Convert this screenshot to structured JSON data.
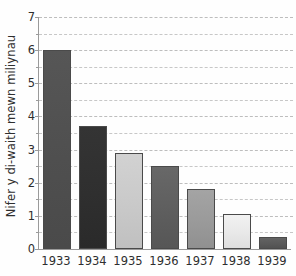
{
  "chart_data": {
    "type": "bar",
    "title": "",
    "subtitle": "",
    "xlabel": "",
    "ylabel": "Nifer y di-waith mewn miliynau",
    "categories": [
      "1933",
      "1934",
      "1935",
      "1936",
      "1937",
      "1938",
      "1939"
    ],
    "values": [
      6.0,
      3.7,
      2.9,
      2.5,
      1.8,
      1.05,
      0.35
    ],
    "ylim": [
      0,
      7
    ],
    "xlim_note": "categorical",
    "y_ticks": [
      0,
      1,
      2,
      3,
      4,
      5,
      6,
      7
    ],
    "y_tick_labels": [
      "0",
      "1",
      "2",
      "3",
      "4",
      "5",
      "6",
      "7"
    ],
    "gridlines": {
      "horizontal": true,
      "vertical": false,
      "style": "dashed",
      "interval": 0.5,
      "color": "#c7c7c7",
      "values": [
        0.5,
        1,
        1.5,
        2,
        2.5,
        3,
        3.5,
        4,
        4.5,
        5,
        5.5,
        6,
        6.5,
        7
      ]
    },
    "legend": {
      "visible": false,
      "position": "none",
      "entries": []
    },
    "annotations": [],
    "bar_colors": [
      "#4f4f4f",
      "#2f2f2f",
      "#c9c9c9",
      "#5e5e5e",
      "#9a9a9a",
      "#e8e8e8",
      "#5a5a5a"
    ],
    "bar_gradient_tops": [
      "#565656",
      "#343434",
      "#d2d2d2",
      "#686868",
      "#a4a4a4",
      "#f1f1f1",
      "#636363"
    ],
    "bar_gradient_bottoms": [
      "#4a4a4a",
      "#2a2a2a",
      "#c0c0c0",
      "#565656",
      "#909090",
      "#dedede",
      "#525252"
    ],
    "bar_outline_color": "#4a4a4a",
    "axis_color": "#9a9a9a",
    "text_color": "#2e2e2e",
    "background_color": "#fefefe"
  },
  "axes": {
    "y_title": "Nifer y di-waith mewn miliynau"
  }
}
